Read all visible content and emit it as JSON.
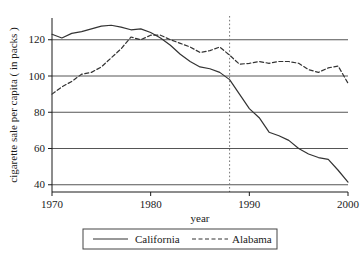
{
  "chart_data": {
    "type": "line",
    "title": "",
    "xlabel": "year",
    "ylabel": "cigarette sale per capita ( in packs )",
    "xlim": [
      1970,
      2000
    ],
    "ylim": [
      36,
      132
    ],
    "grid": true,
    "gridlines_y": [
      40,
      60,
      80,
      100,
      120
    ],
    "xticks": [
      1970,
      1980,
      1990,
      2000
    ],
    "xtick_labels": [
      "1970",
      "1980",
      "1990",
      "2000"
    ],
    "yticks": [
      40,
      60,
      80,
      100,
      120
    ],
    "ytick_labels": [
      "40",
      "60",
      "80",
      "100",
      "120"
    ],
    "legend_position": "below-axis-centered",
    "annotations": [
      {
        "name": "intervention-line",
        "type": "vline",
        "x": 1988,
        "style": "dotted",
        "color": "#777777"
      }
    ],
    "x": [
      1970,
      1971,
      1972,
      1973,
      1974,
      1975,
      1976,
      1977,
      1978,
      1979,
      1980,
      1981,
      1982,
      1983,
      1984,
      1985,
      1986,
      1987,
      1988,
      1989,
      1990,
      1991,
      1992,
      1993,
      1994,
      1995,
      1996,
      1997,
      1998,
      1999,
      2000
    ],
    "series": [
      {
        "name": "California",
        "style": "solid",
        "color": "#333333",
        "values": [
          123,
          121,
          123.5,
          124.5,
          126,
          127.5,
          128,
          127,
          125.5,
          126,
          124,
          121,
          117,
          112,
          108,
          105,
          104,
          102,
          98,
          90,
          82,
          77,
          69,
          67,
          64.5,
          60,
          57,
          55,
          54,
          48,
          41.5
        ]
      },
      {
        "name": "Alabama",
        "style": "dashed",
        "color": "#333333",
        "values": [
          90,
          94,
          97,
          101,
          102,
          105,
          110,
          115,
          121.5,
          120,
          122.5,
          122.5,
          120,
          118,
          116,
          113,
          114,
          116,
          111.5,
          106.5,
          107,
          108,
          107,
          108,
          108,
          107,
          103.5,
          102,
          104.5,
          105.5,
          96
        ]
      }
    ]
  },
  "legend": {
    "items": [
      {
        "label": "California",
        "style": "solid"
      },
      {
        "label": "Alabama",
        "style": "dashed"
      }
    ]
  },
  "axes": {
    "y_title": "cigarette sale per capita ( in packs )",
    "x_title": "year"
  },
  "colors": {
    "line": "#333333",
    "grid": "#555555",
    "axis": "#1a1a1a",
    "annotation": "#888888",
    "background": "#ffffff"
  }
}
